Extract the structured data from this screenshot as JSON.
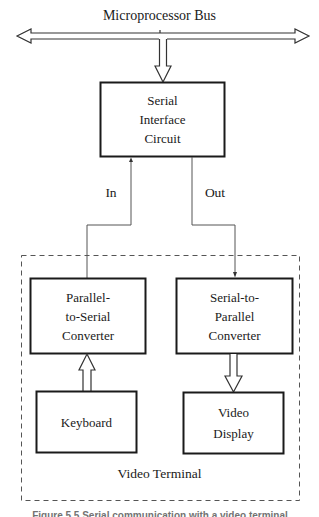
{
  "diagram": {
    "bus": {
      "label": "Microprocessor Bus"
    },
    "nodes": {
      "serial_interface": {
        "lines": [
          "Serial",
          "Interface",
          "Circuit"
        ]
      },
      "parallel_to_serial": {
        "lines": [
          "Parallel-",
          "to-Serial",
          "Converter"
        ]
      },
      "serial_to_parallel": {
        "lines": [
          "Serial-to-",
          "Parallel",
          "Converter"
        ]
      },
      "keyboard": {
        "lines": [
          "Keyboard"
        ]
      },
      "video_display": {
        "lines": [
          "Video",
          "Display"
        ]
      }
    },
    "edges": {
      "in_label": "In",
      "out_label": "Out"
    },
    "group": {
      "label": "Video Terminal"
    },
    "caption": "Figure 5.5  Serial communication with a video terminal"
  },
  "colors": {
    "stroke": "#1a1a1a",
    "thin_line": "#555555",
    "dashed": "#555555",
    "background": "#ffffff"
  }
}
